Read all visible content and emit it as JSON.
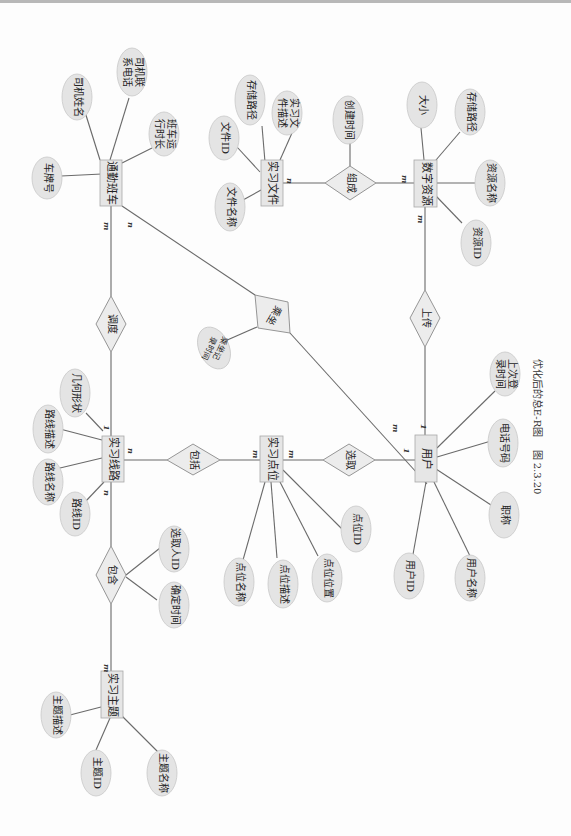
{
  "caption": {
    "number": "图 2.3.20",
    "title": "优化后的总E-R图"
  },
  "entities": {
    "commute_bus": "通勤班车",
    "study_file": "实习文件",
    "digital_resource": "数字资源",
    "route": "实习线路",
    "point": "实习点位",
    "user": "用户",
    "theme": "实习主题"
  },
  "attributes": {
    "commute_bus": [
      "车牌号",
      "司机姓名",
      "司机联系电话",
      "班车运行时长"
    ],
    "study_file": [
      "文件名称",
      "文件ID",
      "存储路径",
      "实习文件描述"
    ],
    "digital_resource": [
      "大小",
      "存储路径",
      "资源名称",
      "资源ID"
    ],
    "route": [
      "几何形状",
      "路线描述",
      "路线名称",
      "路线ID"
    ],
    "point": [
      "点位名称",
      "点位描述",
      "点位位置",
      "点位ID"
    ],
    "user": [
      "上次登录时间",
      "电话号码",
      "职称",
      "用户名称",
      "用户ID"
    ],
    "theme": [
      "主题描述",
      "主题ID",
      "主题名称"
    ]
  },
  "relationships": {
    "dispatch": {
      "label": "调度",
      "card_bus": "m",
      "card_route": "1"
    },
    "ride": {
      "label": "乘坐",
      "attribute": "乘坐记录时间",
      "card_bus": "n",
      "card_user": "m"
    },
    "compose": {
      "label": "组成",
      "attribute": "创建时间",
      "card_file": "n",
      "card_resource": "m"
    },
    "upload": {
      "label": "上传",
      "card_resource": "m",
      "card_user": "1"
    },
    "include_points": {
      "label": "包括",
      "card_route": "n",
      "card_point": "m"
    },
    "select": {
      "label": "选取",
      "card_point": "m",
      "card_user": "1"
    },
    "contain": {
      "label": "包含",
      "attributes": [
        "选取人ID",
        "确定时间"
      ],
      "card_route": "n",
      "card_theme": "m"
    }
  }
}
